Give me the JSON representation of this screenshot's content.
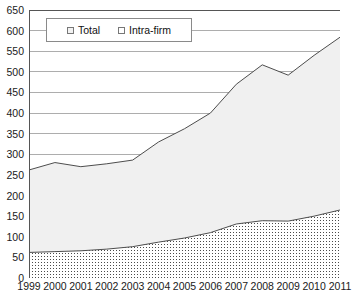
{
  "chart_data": {
    "type": "area",
    "title": "",
    "subtitle": "",
    "xlabel": "",
    "ylabel": "",
    "categories": [
      "1999",
      "2000",
      "2001",
      "2002",
      "2003",
      "2004",
      "2005",
      "2006",
      "2007",
      "2008",
      "2009",
      "2010",
      "2011"
    ],
    "series": [
      {
        "name": "Total",
        "values": [
          262,
          280,
          270,
          277,
          286,
          330,
          362,
          400,
          470,
          517,
          492,
          540,
          584
        ],
        "fill": "#f0f0f0",
        "line": "#4d4d4d",
        "marker": "empty-square"
      },
      {
        "name": "Intra-firm",
        "values": [
          62,
          64,
          66,
          70,
          76,
          87,
          97,
          110,
          131,
          139,
          138,
          150,
          165
        ],
        "fill": "#ffffff",
        "line": "#4d4d4d",
        "marker": "dotted-square"
      }
    ],
    "ylim": [
      0,
      650
    ],
    "ystep": 50,
    "yticks": [
      0,
      50,
      100,
      150,
      200,
      250,
      300,
      350,
      400,
      450,
      500,
      550,
      600,
      650
    ],
    "xticks": [
      "1999",
      "2000",
      "2001",
      "2002",
      "2003",
      "2004",
      "2005",
      "2006",
      "2007",
      "2008",
      "2009",
      "2010",
      "2011"
    ],
    "grid": "horizontal",
    "grid_color": "#999999",
    "legend_position": "top-left-inside",
    "axis_color": "#555555",
    "plot_background": "#ffffff"
  },
  "legend": {
    "items": [
      {
        "label": "Total",
        "swatch": "legend-swatch-total"
      },
      {
        "label": "Intra-firm",
        "swatch": "legend-swatch-intra-firm"
      }
    ]
  }
}
